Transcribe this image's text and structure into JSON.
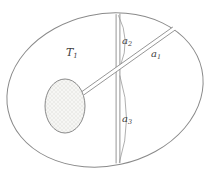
{
  "figure": {
    "background": "#ffffff",
    "line_color": "#8a8a8a",
    "arc_color": "#9b9b9b",
    "label_color": "#3f3f3f",
    "hatch_fill": "#f6f6f4",
    "hatch_line": "#e2e2de",
    "labels": {
      "region": {
        "base": "T",
        "sub": "1"
      },
      "a1": {
        "base": "a",
        "sub": "1"
      },
      "a2": {
        "base": "a",
        "sub": "2"
      },
      "a3": {
        "base": "a",
        "sub": "3"
      }
    }
  }
}
